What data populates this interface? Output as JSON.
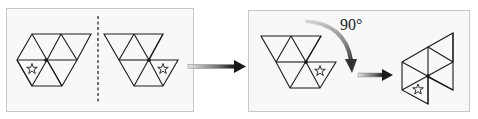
{
  "figure": {
    "panels": [
      {
        "name": "reflection-panel",
        "contents": [
          "original-shape",
          "mirror-line",
          "reflected-shape"
        ]
      },
      {
        "name": "rotation-panel",
        "contents": [
          "reflected-shape",
          "rotation-arrow",
          "rotated-shape"
        ]
      }
    ],
    "rotation_label": "90°",
    "colors": {
      "panel_border": "#c8c8c8",
      "panel_fill": "#f7f7f7",
      "stroke": "#1a1a1a",
      "arrow_dark": "#222222",
      "arrow_light": "#d8d8d8"
    },
    "marker": "star"
  }
}
